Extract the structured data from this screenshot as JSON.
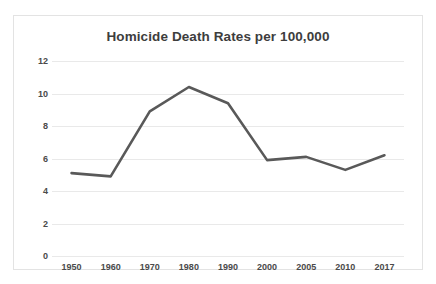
{
  "chart_data": {
    "type": "line",
    "title": "Homicide Death Rates per 100,000",
    "xlabel": "",
    "ylabel": "",
    "categories": [
      "1950",
      "1960",
      "1970",
      "1980",
      "1990",
      "2000",
      "2005",
      "2010",
      "2017"
    ],
    "values": [
      5.1,
      4.9,
      8.9,
      10.4,
      9.4,
      5.9,
      6.1,
      5.3,
      6.2
    ],
    "series": [
      {
        "name": "Homicide Death Rate",
        "values": [
          5.1,
          4.9,
          8.9,
          10.4,
          9.4,
          5.9,
          6.1,
          5.3,
          6.2
        ]
      }
    ],
    "ylim": [
      0,
      12
    ],
    "ytick_labels": [
      "0",
      "2",
      "4",
      "6",
      "8",
      "10",
      "12"
    ],
    "ytick_values": [
      0,
      2,
      4,
      6,
      8,
      10,
      12
    ],
    "grid": "horizontal",
    "legend": "none",
    "line_color": "#595959",
    "grid_color": "#e9e9e9",
    "text_color": "#4a4a4a",
    "title_color": "#3d3d3d",
    "background": "#ffffff",
    "border_color": "#e3e3e3"
  }
}
